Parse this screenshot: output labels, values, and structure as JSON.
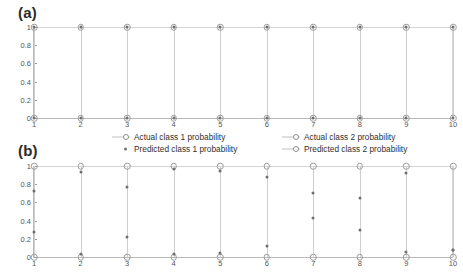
{
  "figure": {
    "panel_a_label": "(a)",
    "panel_b_label": "(b)"
  },
  "legend": {
    "items": [
      {
        "label": "Actual class 1 probability",
        "marker": "line-open-circle",
        "column": 1,
        "row": 1
      },
      {
        "label": "Predicted class 1 probability",
        "marker": "small-dot",
        "column": 1,
        "row": 2
      },
      {
        "label": "Actual class 2 probability",
        "marker": "line-open-circle",
        "column": 2,
        "row": 1
      },
      {
        "label": "Predicted class 2 probability",
        "marker": "line-open-circle",
        "column": 2,
        "row": 2
      }
    ]
  },
  "chart_data": [
    {
      "type": "scatter",
      "panel": "(a)",
      "title": "",
      "xlabel": "",
      "ylabel": "",
      "x": [
        1,
        2,
        3,
        4,
        5,
        6,
        7,
        8,
        9,
        10
      ],
      "xlim": [
        1,
        10
      ],
      "ylim": [
        0,
        1
      ],
      "xticks": [
        "1",
        "2",
        "3",
        "4",
        "5",
        "6",
        "7",
        "8",
        "9",
        "10"
      ],
      "yticks": [
        "0",
        "0.2",
        "0.4",
        "0.6",
        "0.8",
        "1"
      ],
      "grid": false,
      "legend_position": "below",
      "series": [
        {
          "name": "Actual class 1 probability",
          "marker": "open-circle",
          "values": [
            1,
            1,
            1,
            1,
            1,
            1,
            1,
            1,
            1,
            1
          ]
        },
        {
          "name": "Predicted class 1 probability",
          "marker": "dot",
          "values": [
            1,
            1,
            1,
            1,
            1,
            1,
            1,
            1,
            1,
            1
          ]
        },
        {
          "name": "Actual class 2 probability",
          "marker": "open-circle",
          "values": [
            0,
            0,
            0,
            0,
            0,
            0,
            0,
            0,
            0,
            0
          ]
        },
        {
          "name": "Predicted class 2 probability",
          "marker": "dot",
          "values": [
            0,
            0,
            0,
            0,
            0,
            0,
            0,
            0,
            0,
            0
          ]
        }
      ]
    },
    {
      "type": "scatter",
      "panel": "(b)",
      "title": "",
      "xlabel": "",
      "ylabel": "",
      "x": [
        1,
        2,
        3,
        4,
        5,
        6,
        7,
        8,
        9,
        10
      ],
      "xlim": [
        1,
        10
      ],
      "ylim": [
        0,
        1
      ],
      "xticks": [
        "1",
        "2",
        "3",
        "4",
        "5",
        "6",
        "7",
        "8",
        "9",
        "10"
      ],
      "yticks": [
        "0",
        "0.2",
        "0.4",
        "0.6",
        "0.8",
        "1"
      ],
      "grid": false,
      "legend_position": "above",
      "series": [
        {
          "name": "Actual class 1 probability",
          "marker": "open-circle",
          "values": [
            1,
            1,
            1,
            1,
            1,
            1,
            1,
            1,
            1,
            1
          ]
        },
        {
          "name": "Predicted class 1 probability",
          "marker": "dot",
          "values": [
            0.73,
            0.93,
            0.77,
            0.97,
            0.95,
            0.88,
            0.7,
            0.65,
            0.92,
            0.08
          ]
        },
        {
          "name": "Actual class 2 probability",
          "marker": "open-circle",
          "values": [
            0,
            0,
            0,
            0,
            0,
            0,
            0,
            0,
            0,
            0
          ]
        },
        {
          "name": "Predicted class 2 probability",
          "marker": "dot",
          "values": [
            0.27,
            0.03,
            0.22,
            0.03,
            0.04,
            0.12,
            0.43,
            0.3,
            0.05,
            0.08
          ]
        }
      ]
    }
  ]
}
